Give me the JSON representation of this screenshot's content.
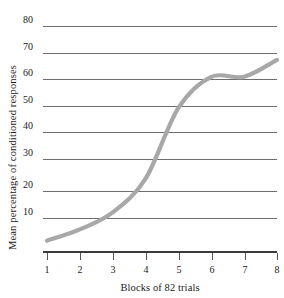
{
  "chart_data": {
    "type": "line",
    "title": "",
    "xlabel": "Blocks of 82 trials",
    "ylabel": "Mean percentage of conditioned responses",
    "categories": [
      1,
      2,
      3,
      4,
      5,
      6,
      7,
      8
    ],
    "x": [
      1,
      2,
      3,
      4,
      5,
      6,
      7,
      8
    ],
    "values": [
      4,
      8,
      14,
      26,
      51,
      62,
      62,
      68
    ],
    "series": [
      {
        "name": "Mean percentage of conditioned responses",
        "values": [
          4,
          8,
          14,
          26,
          51,
          62,
          62,
          68
        ]
      }
    ],
    "xtick_labels": [
      "1",
      "2",
      "3",
      "4",
      "5",
      "6",
      "7",
      "8"
    ],
    "ytick_labels": [
      "10",
      "20",
      "30",
      "40",
      "50",
      "60",
      "70",
      "80"
    ],
    "ytick_values": [
      10,
      20,
      30,
      40,
      50,
      60,
      70,
      80
    ],
    "ylim": [
      0,
      80
    ],
    "xlim": [
      1,
      8
    ],
    "grid": "horizontal",
    "legend": "none",
    "line_color": "#a8a8a8",
    "gridline_color": "#6e6e6e",
    "axis_color": "#3a3a3a",
    "background_color": "#ffffff"
  }
}
